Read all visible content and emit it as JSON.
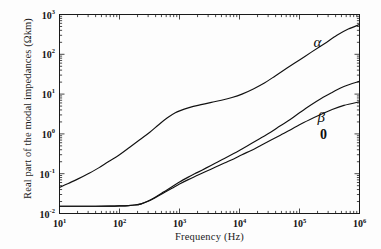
{
  "chart_data": {
    "type": "line",
    "title": "",
    "xlabel": "Frequency (Hz)",
    "ylabel": "Real part of the modal impedances (Ωkm)",
    "xscale": "log",
    "yscale": "log",
    "xlim": [
      10,
      1000000
    ],
    "ylim": [
      0.01,
      1000
    ],
    "xticks": [
      "10",
      "1",
      "10",
      "2",
      "10",
      "3",
      "10",
      "4",
      "10",
      "5",
      "10",
      "6"
    ],
    "xtick_labels": [
      {
        "mantissa": "10",
        "exponent": "1",
        "value": 10
      },
      {
        "mantissa": "10",
        "exponent": "2",
        "value": 100
      },
      {
        "mantissa": "10",
        "exponent": "3",
        "value": 1000
      },
      {
        "mantissa": "10",
        "exponent": "4",
        "value": 10000
      },
      {
        "mantissa": "10",
        "exponent": "5",
        "value": 100000
      },
      {
        "mantissa": "10",
        "exponent": "6",
        "value": 1000000
      }
    ],
    "ytick_labels": [
      {
        "mantissa": "10",
        "exponent": "-2",
        "value": 0.01
      },
      {
        "mantissa": "10",
        "exponent": "-1",
        "value": 0.1
      },
      {
        "mantissa": "10",
        "exponent": "0",
        "value": 1
      },
      {
        "mantissa": "10",
        "exponent": "1",
        "value": 10
      },
      {
        "mantissa": "10",
        "exponent": "2",
        "value": 100
      },
      {
        "mantissa": "10",
        "exponent": "3",
        "value": 1000
      }
    ],
    "grid": false,
    "legend": "inline-annotations",
    "line_color": "#111111",
    "series": [
      {
        "name": "α",
        "label": "α",
        "label_x": 200000,
        "label_y": 200,
        "points": [
          [
            10,
            0.045
          ],
          [
            14,
            0.057
          ],
          [
            20,
            0.073
          ],
          [
            30,
            0.1
          ],
          [
            45,
            0.14
          ],
          [
            65,
            0.2
          ],
          [
            100,
            0.3
          ],
          [
            150,
            0.47
          ],
          [
            220,
            0.72
          ],
          [
            320,
            1.1
          ],
          [
            450,
            1.7
          ],
          [
            620,
            2.5
          ],
          [
            850,
            3.4
          ],
          [
            1200,
            4.2
          ],
          [
            1700,
            4.9
          ],
          [
            2400,
            5.5
          ],
          [
            3400,
            6.2
          ],
          [
            5000,
            7.0
          ],
          [
            7500,
            8.2
          ],
          [
            11000,
            10.0
          ],
          [
            17000,
            13.5
          ],
          [
            26000,
            19.0
          ],
          [
            40000,
            29.0
          ],
          [
            62000,
            45.0
          ],
          [
            100000,
            72.0
          ],
          [
            160000,
            115.0
          ],
          [
            260000,
            185.0
          ],
          [
            420000,
            300.0
          ],
          [
            650000,
            430.0
          ],
          [
            1000000,
            560.0
          ]
        ]
      },
      {
        "name": "β",
        "label": "β",
        "label_x": 230000,
        "label_y": 2.6,
        "points": [
          [
            10,
            0.0152
          ],
          [
            20,
            0.0152
          ],
          [
            40,
            0.0152
          ],
          [
            70,
            0.0153
          ],
          [
            100,
            0.0155
          ],
          [
            140,
            0.0158
          ],
          [
            180,
            0.0163
          ],
          [
            230,
            0.0175
          ],
          [
            300,
            0.0205
          ],
          [
            400,
            0.026
          ],
          [
            550,
            0.035
          ],
          [
            750,
            0.047
          ],
          [
            1000,
            0.062
          ],
          [
            1400,
            0.082
          ],
          [
            2000,
            0.108
          ],
          [
            2800,
            0.14
          ],
          [
            4000,
            0.185
          ],
          [
            5600,
            0.24
          ],
          [
            8000,
            0.32
          ],
          [
            11000,
            0.42
          ],
          [
            16000,
            0.58
          ],
          [
            23000,
            0.8
          ],
          [
            33000,
            1.1
          ],
          [
            48000,
            1.6
          ],
          [
            70000,
            2.3
          ],
          [
            100000,
            3.4
          ],
          [
            150000,
            5.2
          ],
          [
            230000,
            7.8
          ],
          [
            350000,
            11.0
          ],
          [
            550000,
            15.5
          ],
          [
            1000000,
            21.0
          ]
        ]
      },
      {
        "name": "0",
        "label": "0",
        "label_x": 250000,
        "label_y": 0.95,
        "points": [
          [
            10,
            0.0152
          ],
          [
            20,
            0.0152
          ],
          [
            40,
            0.0152
          ],
          [
            70,
            0.0153
          ],
          [
            100,
            0.0155
          ],
          [
            140,
            0.0158
          ],
          [
            180,
            0.0163
          ],
          [
            230,
            0.0175
          ],
          [
            300,
            0.0203
          ],
          [
            400,
            0.0253
          ],
          [
            550,
            0.033
          ],
          [
            750,
            0.043
          ],
          [
            1000,
            0.055
          ],
          [
            1400,
            0.071
          ],
          [
            2000,
            0.091
          ],
          [
            2800,
            0.115
          ],
          [
            4000,
            0.147
          ],
          [
            5600,
            0.185
          ],
          [
            8000,
            0.235
          ],
          [
            11000,
            0.3
          ],
          [
            16000,
            0.39
          ],
          [
            23000,
            0.52
          ],
          [
            33000,
            0.69
          ],
          [
            48000,
            0.93
          ],
          [
            70000,
            1.25
          ],
          [
            100000,
            1.7
          ],
          [
            150000,
            2.3
          ],
          [
            230000,
            3.1
          ],
          [
            350000,
            4.1
          ],
          [
            550000,
            5.2
          ],
          [
            1000000,
            6.4
          ]
        ]
      }
    ]
  }
}
